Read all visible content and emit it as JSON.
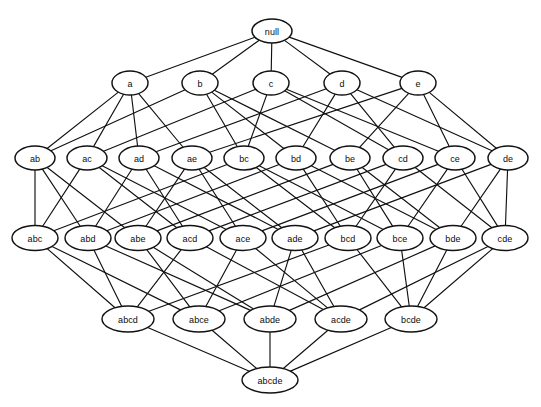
{
  "diagram": {
    "kind": "hasse-diagram",
    "background_color": "#ffffff",
    "node_fill_color": "#ffffff",
    "node_stroke_color": "#121212",
    "edge_color": "#111111",
    "label_color": "#0b0b0b",
    "caption": ""
  },
  "levels": [
    {
      "name": "level-0-empty-set",
      "cardinality": 0,
      "y": 31
    },
    {
      "name": "level-1-singletons",
      "cardinality": 1,
      "y": 83
    },
    {
      "name": "level-2-pairs",
      "cardinality": 2,
      "y": 158
    },
    {
      "name": "level-3-triples",
      "cardinality": 3,
      "y": 238
    },
    {
      "name": "level-4-quadruples",
      "cardinality": 4,
      "y": 319
    },
    {
      "name": "level-5-full-set",
      "cardinality": 5,
      "y": 380
    }
  ],
  "nodes": [
    {
      "id": "null",
      "label": "null",
      "level": 0,
      "x": 272,
      "y": 31,
      "rx": 20,
      "ry": 12
    },
    {
      "id": "a",
      "label": "a",
      "level": 1,
      "x": 130,
      "y": 83,
      "rx": 18,
      "ry": 12
    },
    {
      "id": "b",
      "label": "b",
      "level": 1,
      "x": 200,
      "y": 83,
      "rx": 18,
      "ry": 12
    },
    {
      "id": "c",
      "label": "c",
      "level": 1,
      "x": 271,
      "y": 83,
      "rx": 18,
      "ry": 12
    },
    {
      "id": "d",
      "label": "d",
      "level": 1,
      "x": 342,
      "y": 83,
      "rx": 18,
      "ry": 12
    },
    {
      "id": "e",
      "label": "e",
      "level": 1,
      "x": 418,
      "y": 83,
      "rx": 18,
      "ry": 12
    },
    {
      "id": "ab",
      "label": "ab",
      "level": 2,
      "x": 35,
      "y": 158,
      "rx": 20,
      "ry": 12
    },
    {
      "id": "ac",
      "label": "ac",
      "level": 2,
      "x": 87,
      "y": 158,
      "rx": 20,
      "ry": 12
    },
    {
      "id": "ad",
      "label": "ad",
      "level": 2,
      "x": 139,
      "y": 158,
      "rx": 20,
      "ry": 12
    },
    {
      "id": "ae",
      "label": "ae",
      "level": 2,
      "x": 192,
      "y": 158,
      "rx": 20,
      "ry": 12
    },
    {
      "id": "bc",
      "label": "bc",
      "level": 2,
      "x": 244,
      "y": 158,
      "rx": 20,
      "ry": 12
    },
    {
      "id": "bd",
      "label": "bd",
      "level": 2,
      "x": 296,
      "y": 158,
      "rx": 20,
      "ry": 12
    },
    {
      "id": "be",
      "label": "be",
      "level": 2,
      "x": 350,
      "y": 158,
      "rx": 20,
      "ry": 12
    },
    {
      "id": "cd",
      "label": "cd",
      "level": 2,
      "x": 403,
      "y": 158,
      "rx": 20,
      "ry": 12
    },
    {
      "id": "ce",
      "label": "ce",
      "level": 2,
      "x": 455,
      "y": 158,
      "rx": 20,
      "ry": 12
    },
    {
      "id": "de",
      "label": "de",
      "level": 2,
      "x": 508,
      "y": 158,
      "rx": 20,
      "ry": 12
    },
    {
      "id": "abc",
      "label": "abc",
      "level": 3,
      "x": 35,
      "y": 238,
      "rx": 23,
      "ry": 12.5
    },
    {
      "id": "abd",
      "label": "abd",
      "level": 3,
      "x": 88,
      "y": 238,
      "rx": 23,
      "ry": 12.5
    },
    {
      "id": "abe",
      "label": "abe",
      "level": 3,
      "x": 138,
      "y": 238,
      "rx": 23,
      "ry": 12.5
    },
    {
      "id": "acd",
      "label": "acd",
      "level": 3,
      "x": 190,
      "y": 238,
      "rx": 23,
      "ry": 12.5
    },
    {
      "id": "ace",
      "label": "ace",
      "level": 3,
      "x": 243,
      "y": 238,
      "rx": 23,
      "ry": 12.5
    },
    {
      "id": "ade",
      "label": "ade",
      "level": 3,
      "x": 295,
      "y": 238,
      "rx": 23,
      "ry": 12.5
    },
    {
      "id": "bcd",
      "label": "bcd",
      "level": 3,
      "x": 348,
      "y": 238,
      "rx": 23,
      "ry": 12.5
    },
    {
      "id": "bce",
      "label": "bce",
      "level": 3,
      "x": 400,
      "y": 238,
      "rx": 23,
      "ry": 12.5
    },
    {
      "id": "bde",
      "label": "bde",
      "level": 3,
      "x": 453,
      "y": 238,
      "rx": 23,
      "ry": 12.5
    },
    {
      "id": "cde",
      "label": "cde",
      "level": 3,
      "x": 505,
      "y": 238,
      "rx": 23,
      "ry": 12.5
    },
    {
      "id": "abcd",
      "label": "abcd",
      "level": 4,
      "x": 128,
      "y": 319,
      "rx": 26,
      "ry": 13
    },
    {
      "id": "abce",
      "label": "abce",
      "level": 4,
      "x": 199,
      "y": 319,
      "rx": 26,
      "ry": 13
    },
    {
      "id": "abde",
      "label": "abde",
      "level": 4,
      "x": 270,
      "y": 319,
      "rx": 26,
      "ry": 13
    },
    {
      "id": "acde",
      "label": "acde",
      "level": 4,
      "x": 341,
      "y": 319,
      "rx": 26,
      "ry": 13
    },
    {
      "id": "bcde",
      "label": "bcde",
      "level": 4,
      "x": 411,
      "y": 319,
      "rx": 26,
      "ry": 13
    },
    {
      "id": "abcde",
      "label": "abcde",
      "level": 5,
      "x": 270,
      "y": 380,
      "rx": 28,
      "ry": 13
    }
  ],
  "edges": [
    [
      "null",
      "a"
    ],
    [
      "null",
      "b"
    ],
    [
      "null",
      "c"
    ],
    [
      "null",
      "d"
    ],
    [
      "null",
      "e"
    ],
    [
      "a",
      "ab"
    ],
    [
      "a",
      "ac"
    ],
    [
      "a",
      "ad"
    ],
    [
      "a",
      "ae"
    ],
    [
      "b",
      "ab"
    ],
    [
      "b",
      "bc"
    ],
    [
      "b",
      "bd"
    ],
    [
      "b",
      "be"
    ],
    [
      "c",
      "ac"
    ],
    [
      "c",
      "bc"
    ],
    [
      "c",
      "cd"
    ],
    [
      "c",
      "ce"
    ],
    [
      "d",
      "ad"
    ],
    [
      "d",
      "bd"
    ],
    [
      "d",
      "cd"
    ],
    [
      "d",
      "de"
    ],
    [
      "e",
      "ae"
    ],
    [
      "e",
      "be"
    ],
    [
      "e",
      "ce"
    ],
    [
      "e",
      "de"
    ],
    [
      "ab",
      "abc"
    ],
    [
      "ab",
      "abd"
    ],
    [
      "ab",
      "abe"
    ],
    [
      "ac",
      "abc"
    ],
    [
      "ac",
      "acd"
    ],
    [
      "ac",
      "ace"
    ],
    [
      "ad",
      "abd"
    ],
    [
      "ad",
      "acd"
    ],
    [
      "ad",
      "ade"
    ],
    [
      "ae",
      "abe"
    ],
    [
      "ae",
      "ace"
    ],
    [
      "ae",
      "ade"
    ],
    [
      "bc",
      "abc"
    ],
    [
      "bc",
      "bcd"
    ],
    [
      "bc",
      "bce"
    ],
    [
      "bd",
      "abd"
    ],
    [
      "bd",
      "bcd"
    ],
    [
      "bd",
      "bde"
    ],
    [
      "be",
      "abe"
    ],
    [
      "be",
      "bce"
    ],
    [
      "be",
      "bde"
    ],
    [
      "cd",
      "acd"
    ],
    [
      "cd",
      "bcd"
    ],
    [
      "cd",
      "cde"
    ],
    [
      "ce",
      "ace"
    ],
    [
      "ce",
      "bce"
    ],
    [
      "ce",
      "cde"
    ],
    [
      "de",
      "ade"
    ],
    [
      "de",
      "bde"
    ],
    [
      "de",
      "cde"
    ],
    [
      "abc",
      "abcd"
    ],
    [
      "abc",
      "abce"
    ],
    [
      "abd",
      "abcd"
    ],
    [
      "abd",
      "abde"
    ],
    [
      "abe",
      "abce"
    ],
    [
      "abe",
      "abde"
    ],
    [
      "acd",
      "abcd"
    ],
    [
      "acd",
      "acde"
    ],
    [
      "ace",
      "abce"
    ],
    [
      "ace",
      "acde"
    ],
    [
      "ade",
      "abde"
    ],
    [
      "ade",
      "acde"
    ],
    [
      "bcd",
      "abcd"
    ],
    [
      "bcd",
      "bcde"
    ],
    [
      "bce",
      "abce"
    ],
    [
      "bce",
      "bcde"
    ],
    [
      "bde",
      "abde"
    ],
    [
      "bde",
      "bcde"
    ],
    [
      "cde",
      "acde"
    ],
    [
      "cde",
      "bcde"
    ],
    [
      "abcd",
      "abcde"
    ],
    [
      "abce",
      "abcde"
    ],
    [
      "abde",
      "abcde"
    ],
    [
      "acde",
      "abcde"
    ],
    [
      "bcde",
      "abcde"
    ]
  ]
}
